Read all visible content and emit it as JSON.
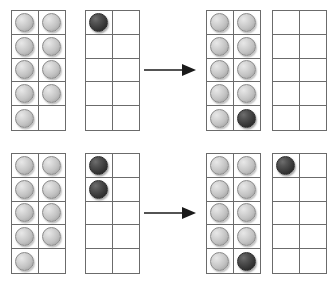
{
  "diagram": {
    "colors": {
      "background": "#ffffff",
      "grid_line": "#6b6b6b",
      "counter_light": "#c2c2c2",
      "counter_dark": "#2a2a2a",
      "arrow": "#1a1a1a"
    },
    "frame_shape": {
      "columns": 2,
      "rows": 5,
      "cells": 10
    },
    "arrow_icon": "right-arrow-icon",
    "counter_states": [
      "light",
      "dark",
      "empty"
    ]
  },
  "rows": [
    {
      "id": "row-top",
      "label": "Example 1",
      "arrow_label": "becomes",
      "left_group": {
        "label": "Before",
        "frames": [
          {
            "id": "top-frame-1",
            "label": "Frame A before",
            "count_light": 9,
            "count_dark": 0,
            "cells": [
              "light",
              "light",
              "light",
              "light",
              "light",
              "light",
              "light",
              "light",
              "light",
              "empty"
            ]
          },
          {
            "id": "top-frame-2",
            "label": "Frame B before",
            "count_light": 0,
            "count_dark": 1,
            "cells": [
              "dark",
              "empty",
              "empty",
              "empty",
              "empty",
              "empty",
              "empty",
              "empty",
              "empty",
              "empty"
            ]
          }
        ]
      },
      "right_group": {
        "label": "After",
        "frames": [
          {
            "id": "top-frame-3",
            "label": "Frame A after",
            "count_light": 9,
            "count_dark": 1,
            "cells": [
              "light",
              "light",
              "light",
              "light",
              "light",
              "light",
              "light",
              "light",
              "light",
              "dark"
            ]
          },
          {
            "id": "top-frame-4",
            "label": "Frame B after",
            "count_light": 0,
            "count_dark": 0,
            "cells": [
              "empty",
              "empty",
              "empty",
              "empty",
              "empty",
              "empty",
              "empty",
              "empty",
              "empty",
              "empty"
            ]
          }
        ]
      }
    },
    {
      "id": "row-bottom",
      "label": "Example 2",
      "arrow_label": "becomes",
      "left_group": {
        "label": "Before",
        "frames": [
          {
            "id": "bottom-frame-1",
            "label": "Frame A before",
            "count_light": 9,
            "count_dark": 0,
            "cells": [
              "light",
              "light",
              "light",
              "light",
              "light",
              "light",
              "light",
              "light",
              "light",
              "empty"
            ]
          },
          {
            "id": "bottom-frame-2",
            "label": "Frame B before",
            "count_light": 0,
            "count_dark": 2,
            "cells": [
              "dark",
              "empty",
              "dark",
              "empty",
              "empty",
              "empty",
              "empty",
              "empty",
              "empty",
              "empty"
            ]
          }
        ]
      },
      "right_group": {
        "label": "After",
        "frames": [
          {
            "id": "bottom-frame-3",
            "label": "Frame A after",
            "count_light": 9,
            "count_dark": 1,
            "cells": [
              "light",
              "light",
              "light",
              "light",
              "light",
              "light",
              "light",
              "light",
              "light",
              "dark"
            ]
          },
          {
            "id": "bottom-frame-4",
            "label": "Frame B after",
            "count_light": 0,
            "count_dark": 1,
            "cells": [
              "dark",
              "empty",
              "empty",
              "empty",
              "empty",
              "empty",
              "empty",
              "empty",
              "empty",
              "empty"
            ]
          }
        ]
      }
    }
  ]
}
